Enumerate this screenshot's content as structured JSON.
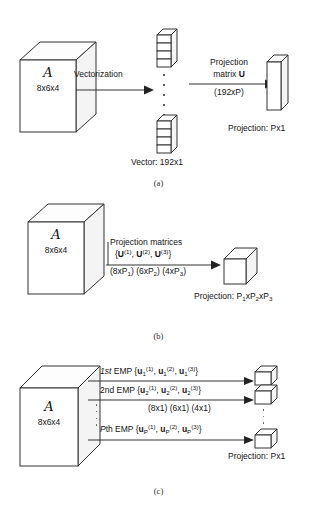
{
  "figure": {
    "panels": [
      {
        "id": "a",
        "caption": "(a)",
        "tensor": {
          "symbol": "A",
          "dims": "8x6x4"
        },
        "arrow1_label": "Vectorization",
        "vector_label": "Vector: 192x1",
        "arrow2_label_line1": "Projection",
        "arrow2_label_line2": "matrix U",
        "arrow2_label_line3": "(192xP)",
        "projection_label": "Projection: Px1"
      },
      {
        "id": "b",
        "caption": "(b)",
        "tensor": {
          "symbol": "A",
          "dims": "8x6x4"
        },
        "arrow_label_line1": "Projection matrices",
        "arrow_label_line2": "{U(1),  U(2),  U(3)}",
        "arrow_label_line3": "(8xP1) (6xP2) (4xP3)",
        "projection_label": "Projection: P1xP2xP3"
      },
      {
        "id": "c",
        "caption": "(c)",
        "tensor": {
          "symbol": "A",
          "dims": "8x6x4"
        },
        "rows": [
          {
            "prefix": "1st",
            "emp": "EMP",
            "set": "{u1(1),  u1(2),  u1(3)}"
          },
          {
            "prefix": "2nd",
            "emp": "EMP",
            "set": "{u2(1),  u2(2),  u2(3)}"
          },
          {
            "prefix": "P",
            "emp": "th EMP",
            "set": "{uP(1),  uP(2),  uP(3)}"
          }
        ],
        "dims_label": "(8x1) (6x1) (4x1)",
        "projection_label": "Projection: Px1"
      }
    ]
  },
  "colors": {
    "stroke": "#333333",
    "text": "#141414",
    "face": "#ffffff",
    "side": "#f4f4f4"
  }
}
